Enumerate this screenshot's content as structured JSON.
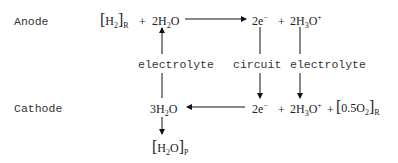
{
  "labels": {
    "anode": "Anode",
    "cathode": "Cathode"
  },
  "anode_eq": {
    "h2_bracket": "[H₂]",
    "h2_bracket_sub": "R",
    "plus1": "+",
    "water": "2H₂O",
    "electrons": "2e⁻",
    "plus2": "+",
    "hydronium": "2H₃O⁺"
  },
  "middle": {
    "electrolyte_left": "electrolyte",
    "circuit": "circuit",
    "electrolyte_right": "electrolyte"
  },
  "cathode_eq": {
    "water": "3H₂O",
    "electrons": "2e⁻",
    "plus1": "+",
    "hydronium": "2H₃O⁺",
    "plus2": "+",
    "o2_bracket": "[0.5O₂]",
    "o2_bracket_sub": "R"
  },
  "product": {
    "water_bracket": "[H₂O]",
    "water_bracket_sub": "P"
  }
}
